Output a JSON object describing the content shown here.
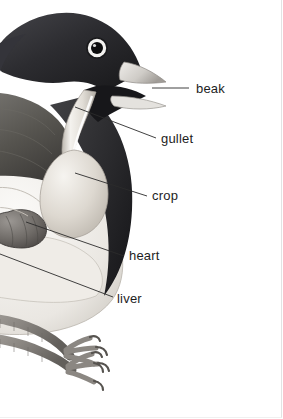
{
  "figure": {
    "background_color": "#ffffff",
    "label_color": "#1d1d1d",
    "leader_line_color": "#2b2b2b",
    "width": 283,
    "height": 419
  },
  "labels": [
    {
      "id": "beak",
      "text": "beak",
      "x": 196,
      "y": 81,
      "leader": {
        "x1": 152,
        "y1": 88,
        "x2": 189,
        "y2": 88
      }
    },
    {
      "id": "gullet",
      "text": "gullet",
      "x": 161,
      "y": 131,
      "leader": {
        "x1": 75,
        "y1": 107,
        "x2": 156,
        "y2": 138
      }
    },
    {
      "id": "crop",
      "text": "crop",
      "x": 152,
      "y": 188,
      "leader": {
        "x1": 75,
        "y1": 173,
        "x2": 147,
        "y2": 196
      }
    },
    {
      "id": "heart",
      "text": "heart",
      "x": 129,
      "y": 248,
      "leader": {
        "x1": 26,
        "y1": 222,
        "x2": 124,
        "y2": 256
      }
    },
    {
      "id": "liver",
      "text": "liver",
      "x": 117,
      "y": 291,
      "leader": {
        "x1": 0,
        "y1": 254,
        "x2": 113,
        "y2": 297
      }
    }
  ],
  "illustration": {
    "parts": [
      {
        "name": "head",
        "tone": "#2f2f31"
      },
      {
        "name": "upper-beak",
        "tone": "#d8d6d2"
      },
      {
        "name": "lower-beak",
        "tone": "#e2e0dc"
      },
      {
        "name": "open-mouth",
        "tone": "#1b1b1c"
      },
      {
        "name": "eye-ring",
        "tone": "#f2f1ef"
      },
      {
        "name": "eye-pupil",
        "tone": "#0d0d0e"
      },
      {
        "name": "wing",
        "tone": "#5c5a58"
      },
      {
        "name": "breast",
        "tone": "#3a3a3c"
      },
      {
        "name": "gullet-tube",
        "tone": "#e9e6e0"
      },
      {
        "name": "crop-sac",
        "tone": "#ded9d2"
      },
      {
        "name": "heart-organ",
        "tone": "#74706e"
      },
      {
        "name": "liver-body",
        "tone": "#e6e3de"
      },
      {
        "name": "belly",
        "tone": "#f1efeb"
      },
      {
        "name": "legs",
        "tone": "#8d8a86"
      },
      {
        "name": "claws",
        "tone": "#6f6c69"
      }
    ]
  }
}
